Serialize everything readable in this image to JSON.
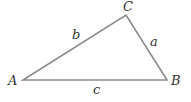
{
  "diagram": {
    "type": "triangle",
    "stroke_color": "#8a8a8a",
    "label_color": "#333333",
    "vertices": [
      {
        "name": "A",
        "x": 23,
        "y": 80,
        "label": "A",
        "lx": 8,
        "ly": 85
      },
      {
        "name": "B",
        "x": 167,
        "y": 80,
        "label": "B",
        "lx": 171,
        "ly": 85
      },
      {
        "name": "C",
        "x": 126,
        "y": 15,
        "label": "C",
        "lx": 123,
        "ly": 11
      }
    ],
    "sides": [
      {
        "name": "a",
        "label": "a",
        "between": [
          "B",
          "C"
        ],
        "lx": 150,
        "ly": 46
      },
      {
        "name": "b",
        "label": "b",
        "between": [
          "A",
          "C"
        ],
        "lx": 72,
        "ly": 39
      },
      {
        "name": "c",
        "label": "c",
        "between": [
          "A",
          "B"
        ],
        "lx": 93,
        "ly": 94
      }
    ]
  }
}
